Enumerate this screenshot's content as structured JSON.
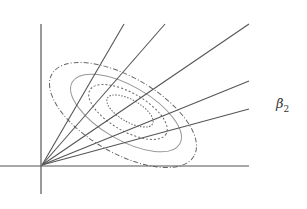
{
  "diagram": {
    "type": "contour-with-rays",
    "background": "#ffffff",
    "line_color": "#555555",
    "axes": {
      "origin": [
        42,
        165
      ],
      "horizontal": {
        "x1": 0,
        "y1": 166,
        "x2": 249,
        "y2": 166
      },
      "vertical": {
        "x1": 41,
        "y1": 24,
        "x2": 41,
        "y2": 194
      },
      "label": {
        "symbol": "β",
        "subscript": "2",
        "x": 276,
        "y": 104
      }
    },
    "rays": [
      {
        "name": "ray-1",
        "x2": 124,
        "y2": 24
      },
      {
        "name": "ray-2",
        "x2": 165,
        "y2": 24
      },
      {
        "name": "ray-3",
        "x2": 249,
        "y2": 24
      },
      {
        "name": "ray-4",
        "x2": 249,
        "y2": 81
      },
      {
        "name": "ray-5",
        "x2": 249,
        "y2": 109
      }
    ],
    "contours": [
      {
        "name": "contour-outer",
        "style": "dash-dot",
        "cx": 123,
        "cy": 115,
        "rx": 82,
        "ry": 38,
        "rotate": 30
      },
      {
        "name": "contour-2",
        "style": "solid-light",
        "cx": 126,
        "cy": 113,
        "rx": 62,
        "ry": 27,
        "rotate": 30
      },
      {
        "name": "contour-3",
        "style": "dotted",
        "cx": 128,
        "cy": 112,
        "rx": 44,
        "ry": 19,
        "rotate": 30
      },
      {
        "name": "contour-4",
        "style": "dotted-fine",
        "cx": 130,
        "cy": 111,
        "rx": 26,
        "ry": 11,
        "rotate": 30
      }
    ]
  }
}
